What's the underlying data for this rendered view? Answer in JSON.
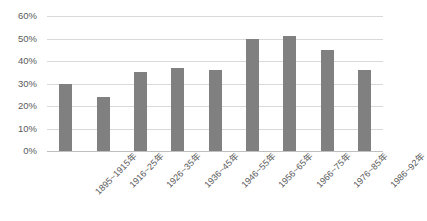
{
  "chart_data": {
    "type": "bar",
    "title": "",
    "xlabel": "",
    "ylabel": "",
    "ylim": [
      0,
      60
    ],
    "grid": true,
    "legend": "none",
    "y_tick_labels": [
      "60%",
      "50%",
      "40%",
      "30%",
      "20%",
      "10%",
      "0%"
    ],
    "y_ticks": [
      60,
      50,
      40,
      30,
      20,
      10,
      0
    ],
    "categories": [
      "1895~1915年",
      "1916~25年",
      "1926~35年",
      "1936~45年",
      "1946~55年",
      "1956~65年",
      "1966~75年",
      "1976~85年",
      "1986~92年"
    ],
    "values": [
      30,
      24,
      35,
      37,
      36,
      50,
      51,
      45,
      36
    ],
    "series": [
      {
        "name": "",
        "values": [
          30,
          24,
          35,
          37,
          36,
          50,
          51,
          45,
          36
        ]
      }
    ],
    "bar_color": "#808080",
    "gridline_color": "#d9d9d9",
    "axis_color": "#bfbfbf",
    "text_color": "#5a5a5a"
  },
  "caption": {
    "text": ""
  }
}
